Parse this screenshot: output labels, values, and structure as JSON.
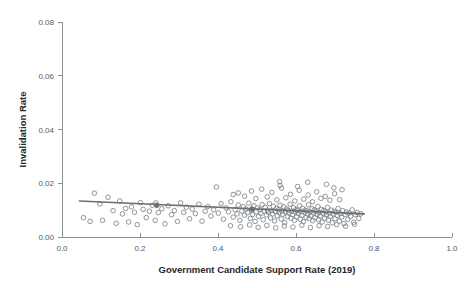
{
  "chart_data": {
    "type": "scatter",
    "title": "",
    "xlabel": "Government Candidate Support Rate (2019)",
    "ylabel": "Invalidation Rate",
    "xlim": [
      0.0,
      1.0
    ],
    "ylim": [
      0.0,
      0.08
    ],
    "xticks": [
      "0.0",
      "0.2",
      "0.4",
      "0.6",
      "0.8",
      "1.0"
    ],
    "xtick_values": [
      0.0,
      0.2,
      0.4,
      0.6,
      0.8,
      1.0
    ],
    "yticks": [
      "0.00",
      "0.02",
      "0.04",
      "0.06",
      "0.08"
    ],
    "ytick_values": [
      0.0,
      0.02,
      0.04,
      0.06,
      0.08
    ],
    "grid": false,
    "legend": null,
    "marker": "open-circle",
    "marker_color": "#7d8287",
    "fit_line": {
      "name": "linear fit",
      "color": "#6b7075",
      "x_start": 0.045,
      "x_end": 0.775,
      "y_start": 0.0134,
      "y_end": 0.0086
    },
    "series": [
      {
        "name": "municipalities",
        "color": "#7d8287",
        "points": [
          [
            0.055,
            0.0072
          ],
          [
            0.072,
            0.0058
          ],
          [
            0.083,
            0.0163
          ],
          [
            0.097,
            0.0123
          ],
          [
            0.104,
            0.0062
          ],
          [
            0.118,
            0.0148
          ],
          [
            0.131,
            0.0098
          ],
          [
            0.139,
            0.0051
          ],
          [
            0.148,
            0.0134
          ],
          [
            0.155,
            0.0086
          ],
          [
            0.163,
            0.0106
          ],
          [
            0.171,
            0.0056
          ],
          [
            0.178,
            0.0112
          ],
          [
            0.186,
            0.0092
          ],
          [
            0.193,
            0.0046
          ],
          [
            0.201,
            0.0128
          ],
          [
            0.208,
            0.0103
          ],
          [
            0.216,
            0.0072
          ],
          [
            0.224,
            0.0096
          ],
          [
            0.232,
            0.0118
          ],
          [
            0.239,
            0.0062
          ],
          [
            0.241,
            0.0127
          ],
          [
            0.247,
            0.0091
          ],
          [
            0.256,
            0.0105
          ],
          [
            0.264,
            0.0049
          ],
          [
            0.272,
            0.0116
          ],
          [
            0.281,
            0.0083
          ],
          [
            0.288,
            0.0098
          ],
          [
            0.296,
            0.0058
          ],
          [
            0.304,
            0.0127
          ],
          [
            0.312,
            0.0092
          ],
          [
            0.319,
            0.0111
          ],
          [
            0.327,
            0.0068
          ],
          [
            0.334,
            0.0104
          ],
          [
            0.342,
            0.0087
          ],
          [
            0.351,
            0.0122
          ],
          [
            0.359,
            0.0059
          ],
          [
            0.367,
            0.0096
          ],
          [
            0.374,
            0.0113
          ],
          [
            0.382,
            0.0078
          ],
          [
            0.389,
            0.0101
          ],
          [
            0.396,
            0.0186
          ],
          [
            0.401,
            0.0089
          ],
          [
            0.408,
            0.0124
          ],
          [
            0.414,
            0.0066
          ],
          [
            0.421,
            0.0108
          ],
          [
            0.427,
            0.0094
          ],
          [
            0.433,
            0.0131
          ],
          [
            0.439,
            0.0074
          ],
          [
            0.444,
            0.0102
          ],
          [
            0.449,
            0.0086
          ],
          [
            0.452,
            0.0119
          ],
          [
            0.456,
            0.0062
          ],
          [
            0.461,
            0.0097
          ],
          [
            0.465,
            0.0113
          ],
          [
            0.468,
            0.0081
          ],
          [
            0.472,
            0.0104
          ],
          [
            0.476,
            0.0091
          ],
          [
            0.479,
            0.0126
          ],
          [
            0.483,
            0.0069
          ],
          [
            0.486,
            0.0099
          ],
          [
            0.489,
            0.0084
          ],
          [
            0.492,
            0.0116
          ],
          [
            0.495,
            0.0058
          ],
          [
            0.498,
            0.0094
          ],
          [
            0.501,
            0.0108
          ],
          [
            0.504,
            0.0077
          ],
          [
            0.507,
            0.0102
          ],
          [
            0.51,
            0.0088
          ],
          [
            0.513,
            0.0121
          ],
          [
            0.516,
            0.0064
          ],
          [
            0.519,
            0.0096
          ],
          [
            0.521,
            0.011
          ],
          [
            0.524,
            0.0082
          ],
          [
            0.527,
            0.01
          ],
          [
            0.529,
            0.0092
          ],
          [
            0.532,
            0.0124
          ],
          [
            0.535,
            0.0071
          ],
          [
            0.537,
            0.0098
          ],
          [
            0.54,
            0.0086
          ],
          [
            0.542,
            0.0114
          ],
          [
            0.545,
            0.006
          ],
          [
            0.547,
            0.0095
          ],
          [
            0.55,
            0.0106
          ],
          [
            0.552,
            0.0079
          ],
          [
            0.555,
            0.0101
          ],
          [
            0.557,
            0.009
          ],
          [
            0.559,
            0.0118
          ],
          [
            0.562,
            0.0067
          ],
          [
            0.564,
            0.0097
          ],
          [
            0.566,
            0.0085
          ],
          [
            0.569,
            0.0112
          ],
          [
            0.571,
            0.0054
          ],
          [
            0.573,
            0.0093
          ],
          [
            0.576,
            0.0104
          ],
          [
            0.578,
            0.0076
          ],
          [
            0.58,
            0.0099
          ],
          [
            0.582,
            0.0089
          ],
          [
            0.585,
            0.0122
          ],
          [
            0.587,
            0.007
          ],
          [
            0.589,
            0.0096
          ],
          [
            0.591,
            0.0083
          ],
          [
            0.594,
            0.0109
          ],
          [
            0.596,
            0.0062
          ],
          [
            0.598,
            0.0094
          ],
          [
            0.6,
            0.0102
          ],
          [
            0.602,
            0.0075
          ],
          [
            0.604,
            0.0098
          ],
          [
            0.606,
            0.0087
          ],
          [
            0.609,
            0.0116
          ],
          [
            0.611,
            0.0066
          ],
          [
            0.613,
            0.0095
          ],
          [
            0.615,
            0.0081
          ],
          [
            0.617,
            0.0107
          ],
          [
            0.619,
            0.0057
          ],
          [
            0.621,
            0.0092
          ],
          [
            0.623,
            0.01
          ],
          [
            0.626,
            0.0073
          ],
          [
            0.628,
            0.0097
          ],
          [
            0.63,
            0.0085
          ],
          [
            0.632,
            0.012
          ],
          [
            0.634,
            0.0068
          ],
          [
            0.636,
            0.0093
          ],
          [
            0.638,
            0.0079
          ],
          [
            0.641,
            0.0105
          ],
          [
            0.643,
            0.0061
          ],
          [
            0.645,
            0.009
          ],
          [
            0.647,
            0.0101
          ],
          [
            0.649,
            0.0072
          ],
          [
            0.651,
            0.0096
          ],
          [
            0.654,
            0.0084
          ],
          [
            0.656,
            0.0113
          ],
          [
            0.658,
            0.0064
          ],
          [
            0.66,
            0.0091
          ],
          [
            0.662,
            0.0078
          ],
          [
            0.665,
            0.0103
          ],
          [
            0.667,
            0.0056
          ],
          [
            0.669,
            0.0088
          ],
          [
            0.671,
            0.0099
          ],
          [
            0.674,
            0.007
          ],
          [
            0.676,
            0.0094
          ],
          [
            0.678,
            0.0082
          ],
          [
            0.681,
            0.011
          ],
          [
            0.683,
            0.0063
          ],
          [
            0.685,
            0.0089
          ],
          [
            0.688,
            0.0076
          ],
          [
            0.69,
            0.01
          ],
          [
            0.693,
            0.0053
          ],
          [
            0.695,
            0.0086
          ],
          [
            0.698,
            0.0096
          ],
          [
            0.7,
            0.0068
          ],
          [
            0.703,
            0.0092
          ],
          [
            0.706,
            0.008
          ],
          [
            0.708,
            0.0106
          ],
          [
            0.711,
            0.0059
          ],
          [
            0.714,
            0.0087
          ],
          [
            0.717,
            0.0074
          ],
          [
            0.72,
            0.0098
          ],
          [
            0.723,
            0.005
          ],
          [
            0.726,
            0.0084
          ],
          [
            0.729,
            0.0093
          ],
          [
            0.733,
            0.0066
          ],
          [
            0.736,
            0.0089
          ],
          [
            0.74,
            0.0077
          ],
          [
            0.744,
            0.0101
          ],
          [
            0.748,
            0.0055
          ],
          [
            0.752,
            0.0083
          ],
          [
            0.757,
            0.0091
          ],
          [
            0.761,
            0.0069
          ],
          [
            0.766,
            0.0086
          ],
          [
            0.452,
            0.0164
          ],
          [
            0.468,
            0.0152
          ],
          [
            0.486,
            0.0171
          ],
          [
            0.497,
            0.0143
          ],
          [
            0.512,
            0.0178
          ],
          [
            0.526,
            0.0149
          ],
          [
            0.538,
            0.0166
          ],
          [
            0.551,
            0.0138
          ],
          [
            0.563,
            0.0182
          ],
          [
            0.574,
            0.0146
          ],
          [
            0.586,
            0.0159
          ],
          [
            0.597,
            0.0134
          ],
          [
            0.608,
            0.0174
          ],
          [
            0.62,
            0.0141
          ],
          [
            0.631,
            0.0156
          ],
          [
            0.642,
            0.0131
          ],
          [
            0.653,
            0.0168
          ],
          [
            0.664,
            0.0144
          ],
          [
            0.675,
            0.0151
          ],
          [
            0.687,
            0.0137
          ],
          [
            0.699,
            0.0161
          ],
          [
            0.712,
            0.0139
          ],
          [
            0.558,
            0.0206
          ],
          [
            0.559,
            0.0192
          ],
          [
            0.439,
            0.0158
          ],
          [
            0.604,
            0.0188
          ],
          [
            0.63,
            0.0204
          ],
          [
            0.678,
            0.0196
          ],
          [
            0.697,
            0.0183
          ],
          [
            0.718,
            0.0176
          ],
          [
            0.432,
            0.0042
          ],
          [
            0.458,
            0.0038
          ],
          [
            0.481,
            0.0045
          ],
          [
            0.503,
            0.0036
          ],
          [
            0.525,
            0.0043
          ],
          [
            0.548,
            0.0034
          ],
          [
            0.57,
            0.0041
          ],
          [
            0.592,
            0.0037
          ],
          [
            0.615,
            0.0044
          ],
          [
            0.637,
            0.0035
          ],
          [
            0.659,
            0.0042
          ],
          [
            0.681,
            0.0039
          ],
          [
            0.704,
            0.0046
          ],
          [
            0.727,
            0.004
          ],
          [
            0.75,
            0.0047
          ]
        ]
      },
      {
        "name": "highlighted",
        "color": "#6e7479",
        "points": [
          [
            0.243,
            0.0118
          ],
          [
            0.487,
            0.0104
          ]
        ]
      }
    ]
  }
}
